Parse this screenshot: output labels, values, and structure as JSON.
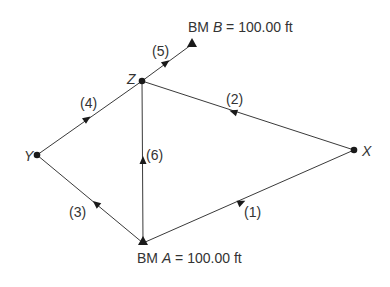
{
  "diagram": {
    "type": "leveling-network",
    "benchmarks": [
      {
        "id": "A",
        "prefix": "BM ",
        "letter": "A",
        "suffix": " = 100.00 ft",
        "x": 143,
        "y": 243
      },
      {
        "id": "B",
        "prefix": "BM ",
        "letter": "B",
        "suffix": " = 100.00 ft",
        "x": 191,
        "y": 44
      }
    ],
    "stations": [
      {
        "id": "X",
        "label": "X",
        "x": 354,
        "y": 150
      },
      {
        "id": "Y",
        "label": "Y",
        "x": 37,
        "y": 155
      },
      {
        "id": "Z",
        "label": "Z",
        "x": 142,
        "y": 81
      }
    ],
    "lines": [
      {
        "id": "1",
        "label": "(1)",
        "from": "A",
        "to": "X"
      },
      {
        "id": "2",
        "label": "(2)",
        "from": "X",
        "to": "Z"
      },
      {
        "id": "3",
        "label": "(3)",
        "from": "A",
        "to": "Y"
      },
      {
        "id": "4",
        "label": "(4)",
        "from": "Y",
        "to": "Z"
      },
      {
        "id": "5",
        "label": "(5)",
        "from": "Z",
        "to": "B"
      },
      {
        "id": "6",
        "label": "(6)",
        "from": "A",
        "to": "Z"
      }
    ],
    "colors": {
      "line": "#3a3a3a",
      "node": "#1a1a1a",
      "text": "#333333"
    }
  }
}
